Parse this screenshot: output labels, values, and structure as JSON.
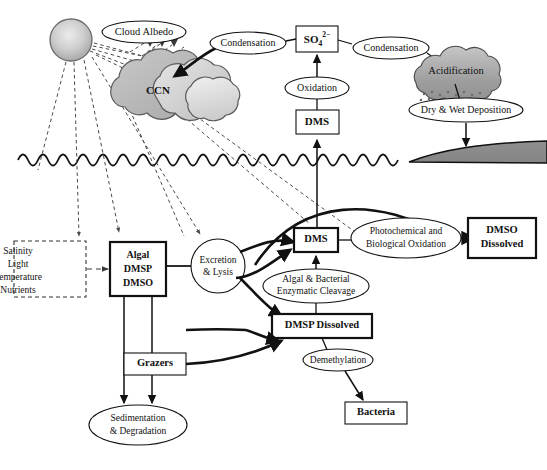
{
  "diagram": {
    "colors": {
      "line": "#111111",
      "dashed_line": "#3a3a3a",
      "cloud_light": "#d9d9d9",
      "cloud_mid": "#b5b5b5",
      "cloud_dark": "#9a9a9a",
      "acid_cloud": "#9c9c9c",
      "acid_cloud_top": "#c2c2c2",
      "land": "#8c8c8c",
      "sun_center": "#e3e3e3",
      "sun_edge": "#a8a8a8",
      "background": "#ffffff"
    },
    "atmosphere": {
      "sun": {
        "name": "sun",
        "label": ""
      },
      "ccn_cloud": {
        "label": "CCN"
      },
      "cloud_albedo": {
        "label": "Cloud Albedo"
      },
      "condensation_left": {
        "label": "Condensation"
      },
      "sulfate": {
        "base": "SO",
        "subscript": "4",
        "superscript": "2−",
        "full": "SO4 2-"
      },
      "condensation_right": {
        "label": "Condensation"
      },
      "oxidation": {
        "label": "Oxidation"
      },
      "dms_air": {
        "label": "DMS"
      },
      "acidification_cloud": {
        "label": "Acidification"
      },
      "deposition": {
        "label": "Dry & Wet Deposition"
      }
    },
    "ocean": {
      "drivers_box": {
        "lines": [
          "Salinity",
          "Light",
          "Temperature",
          "Nutrients"
        ]
      },
      "algal_box": {
        "lines": [
          "Algal",
          "DMSP",
          "DMSO"
        ]
      },
      "excretion": {
        "label_line1": "Excretion",
        "label_line2": "& Lysis"
      },
      "dms_sea": {
        "label": "DMS"
      },
      "photochemical": {
        "label_line1": "Photochemical and",
        "label_line2": "Biological Oxidation"
      },
      "dmso_dissolved": {
        "label_line1": "DMSO",
        "label_line2": "Dissolved"
      },
      "enzymatic_cleavage": {
        "label_line1": "Algal & Bacterial",
        "label_line2": "Enzymatic Cleavage"
      },
      "dmsp_dissolved": {
        "label": "DMSP Dissolved"
      },
      "demethylation": {
        "label": "Demethylation"
      },
      "bacteria": {
        "label": "Bacteria"
      },
      "grazers": {
        "label": "Grazers"
      },
      "sedimentation": {
        "label_line1": "Sedimentation",
        "label_line2": "& Degradation"
      }
    }
  }
}
